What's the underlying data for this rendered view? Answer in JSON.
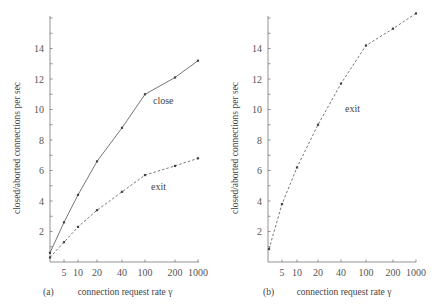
{
  "chart_data": [
    {
      "type": "line",
      "panel_label": "(a)",
      "xlabel": "connection request rate  γ",
      "ylabel": "closed/aborted connections per sec",
      "x_ticks": [
        "",
        "5",
        "10",
        "20",
        "40",
        "100",
        "200",
        "1000"
      ],
      "x": [
        "1",
        "5",
        "10",
        "20",
        "40",
        "100",
        "200",
        "1000"
      ],
      "ylim": [
        0,
        16
      ],
      "y_ticks": [
        2,
        4,
        6,
        8,
        10,
        12,
        14
      ],
      "grid": false,
      "series": [
        {
          "name": "close",
          "style": "solid",
          "values": [
            0.6,
            2.6,
            4.4,
            6.6,
            8.8,
            11.0,
            12.1,
            13.2
          ]
        },
        {
          "name": "exit",
          "style": "dashed",
          "values": [
            0.3,
            1.3,
            2.3,
            3.4,
            4.6,
            5.7,
            6.3,
            6.8
          ]
        }
      ],
      "annotations": [
        "close",
        "exit"
      ]
    },
    {
      "type": "line",
      "panel_label": "(b)",
      "xlabel": "connection request rate  γ",
      "ylabel": "closed/aborted connections per sec",
      "x_ticks": [
        "",
        "5",
        "10",
        "20",
        "40",
        "100",
        "200",
        "1000"
      ],
      "x": [
        "1",
        "5",
        "10",
        "20",
        "40",
        "100",
        "200",
        "1000"
      ],
      "ylim": [
        0,
        16
      ],
      "y_ticks": [
        2,
        4,
        6,
        8,
        10,
        12,
        14
      ],
      "grid": false,
      "series": [
        {
          "name": "exit",
          "style": "dashed",
          "values": [
            0.85,
            3.8,
            6.2,
            9.0,
            11.7,
            14.2,
            15.3,
            16.3
          ]
        }
      ],
      "annotations": [
        "exit"
      ]
    }
  ]
}
